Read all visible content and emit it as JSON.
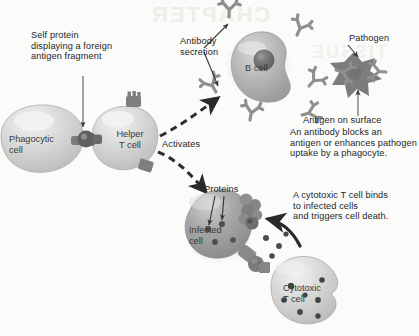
{
  "figure": {
    "background_color": "#fbfbfa",
    "ink_color": "#262626",
    "cell_fill_light": "#d6d6d4",
    "cell_fill_mid": "#a9a9a7",
    "cell_fill_dark": "#6f6f6e",
    "antibody_color": "#8f8f8e",
    "pathogen_color": "#7c7c7b"
  },
  "labels": {
    "self_protein": "Self protein\ndisplaying a foreign\nantigen fragment",
    "phagocytic_cell": "Phagocytic\ncell",
    "helper_t_cell": "Helper\nT cell",
    "activates": "Activates",
    "antibody_secretion": "Antibody\nsecretion",
    "b_cell": "B cell",
    "pathogen": "Pathogen",
    "antigen_on_surface": "Antigen on surface",
    "antibody_note": "An antibody blocks an\nantigen or enhances pathogen\nuptake by a phagocyte.",
    "proteins": "Proteins",
    "infected_cell": "Infected\ncell",
    "cytotoxic_note": "A cytotoxic T cell binds\nto infected cells\nand triggers cell death.",
    "cytotoxic_t_cell": "Cytotoxic\nT cell"
  },
  "icons": {
    "antibody": "antibody-y-shape-icon",
    "pathogen": "pathogen-star-icon",
    "receptor": "mhc-receptor-icon",
    "protein_dot": "protein-dot-icon",
    "arrow": "arrow-icon",
    "dashed_arrow": "dashed-arrow-icon"
  },
  "artifacts": {
    "top": "CHAPTER",
    "mid": "TISSUE"
  }
}
